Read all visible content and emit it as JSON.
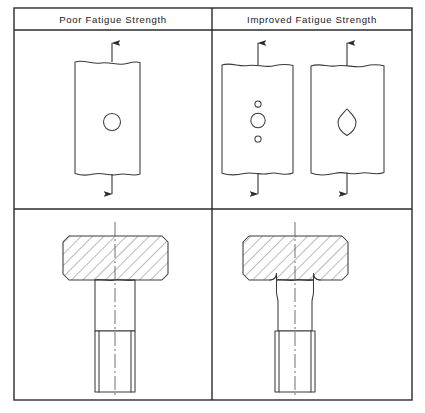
{
  "figure": {
    "title_left": "Poor  Fatigue  Strength",
    "title_right": "Improved  Fatigue  Strength",
    "colors": {
      "frame": "#2b2b2b",
      "part": "#3a3a3a",
      "hatch": "#4a4a4a",
      "centerline": "#555555",
      "background": "#ffffff"
    }
  },
  "cells": {
    "top_left": {
      "name": "plate-single-hole",
      "caption_group": "Poor  Fatigue  Strength",
      "description": "Flat bar in tension with a single round transverse hole",
      "plates": [
        {
          "name": "tension-plate-poor",
          "x": 75,
          "y": 62,
          "width": 65,
          "height": 113,
          "break_top": true,
          "break_bottom": true,
          "holes": [
            {
              "type": "circle",
              "cx": 112,
              "cy": 122,
              "r": 8.5,
              "label": "main-hole"
            }
          ],
          "arrows": [
            {
              "direction": "up",
              "x": 112,
              "from_y": 62,
              "to_y": 40
            },
            {
              "direction": "down",
              "x": 112,
              "from_y": 175,
              "to_y": 197
            }
          ]
        }
      ]
    },
    "top_right": {
      "name": "plate-relief-holes-and-streamlined-hole",
      "caption_group": "Improved  Fatigue  Strength",
      "description": "Flat bars in tension: one with stress-relief holes above and below the main hole, one with a streamlined lens-shaped hole",
      "plates": [
        {
          "name": "tension-plate-relief-holes",
          "x": 222,
          "y": 64,
          "width": 71,
          "height": 111,
          "break_top": true,
          "break_bottom": true,
          "holes": [
            {
              "type": "circle",
              "cx": 258,
              "cy": 104,
              "r": 3.1,
              "label": "relief-hole-upper"
            },
            {
              "type": "circle",
              "cx": 258,
              "cy": 120,
              "r": 7.2,
              "label": "main-hole"
            },
            {
              "type": "circle",
              "cx": 258,
              "cy": 139,
              "r": 3.1,
              "label": "relief-hole-lower"
            }
          ],
          "arrows": [
            {
              "direction": "up",
              "x": 258,
              "from_y": 64,
              "to_y": 40
            },
            {
              "direction": "down",
              "x": 258,
              "from_y": 175,
              "to_y": 197
            }
          ]
        },
        {
          "name": "tension-plate-streamlined-hole",
          "x": 311,
          "y": 64,
          "width": 73,
          "height": 111,
          "break_top": true,
          "break_bottom": true,
          "holes": [
            {
              "type": "lens",
              "cx": 347,
              "cy": 122,
              "rx": 9,
              "ry": 13,
              "label": "streamlined-hole"
            }
          ],
          "arrows": [
            {
              "direction": "up",
              "x": 347,
              "from_y": 64,
              "to_y": 40
            },
            {
              "direction": "down",
              "x": 347,
              "from_y": 175,
              "to_y": 197
            }
          ]
        }
      ]
    },
    "bottom_left": {
      "name": "bolt-sharp-corner",
      "caption_group": "Poor  Fatigue  Strength",
      "description": "Sectioned bolt head meeting the shank at a sharp square corner, straight shank, threaded end",
      "bolt": {
        "head": {
          "x": 63,
          "y": 236,
          "width": 105,
          "height": 44,
          "chamfer": 6
        },
        "shank": {
          "x": 95,
          "y": 280,
          "width": 40,
          "height": 113
        },
        "thread": {
          "x": 95,
          "y": 331,
          "width": 40,
          "height": 62,
          "root_inset": 4
        },
        "fillet": false,
        "necked": false,
        "centerline": {
          "x": 115,
          "from_y": 222,
          "to_y": 400
        }
      }
    },
    "bottom_right": {
      "name": "bolt-filleted-corner",
      "caption_group": "Improved  Fatigue  Strength",
      "description": "Sectioned bolt head with generous fillet radii under the head and a reduced-diameter waisted shank, threaded end",
      "bolt": {
        "head": {
          "x": 243,
          "y": 236,
          "width": 105,
          "height": 44,
          "chamfer": 6
        },
        "shank": {
          "x": 275,
          "y": 280,
          "width": 40,
          "height": 113
        },
        "thread": {
          "x": 275,
          "y": 331,
          "width": 40,
          "height": 62,
          "root_inset": 4
        },
        "fillet": true,
        "fillet_radius": 5,
        "necked": true,
        "neck_inset": 3,
        "centerline": {
          "x": 295,
          "from_y": 222,
          "to_y": 400
        }
      }
    }
  },
  "layout": {
    "frame": {
      "x": 14,
      "y": 8,
      "width": 398,
      "height": 392
    },
    "header_divider_y": 30,
    "middle_divider_y": 209,
    "vertical_divider_x": 212
  }
}
